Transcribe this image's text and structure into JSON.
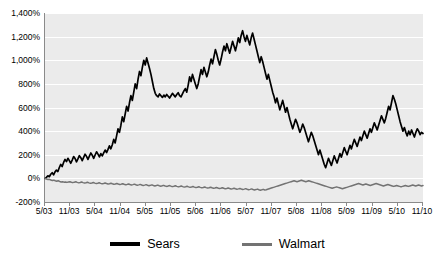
{
  "chart_data": {
    "type": "line",
    "title": "",
    "subtitle": "",
    "xlabel": "",
    "ylabel": "",
    "grid": true,
    "legend_position": "bottom",
    "ylim": [
      -200,
      1400
    ],
    "ytick_step": 200,
    "yticks": [
      1400,
      1200,
      1000,
      800,
      600,
      400,
      200,
      0,
      -200
    ],
    "ytick_labels": [
      "1,400%",
      "1,200%",
      "1,000%",
      "800%",
      "600%",
      "400%",
      "200%",
      "0%",
      "-200%"
    ],
    "xtick_labels": [
      "5/03",
      "11/03",
      "5/04",
      "11/04",
      "5/05",
      "11/05",
      "5/06",
      "11/06",
      "5/07",
      "11/07",
      "5/08",
      "11/08",
      "5/09",
      "11/09",
      "5/10",
      "11/10"
    ],
    "x_start": "5/03",
    "x_end": "11/10",
    "colors": {
      "sears": "#000000",
      "walmart": "#737373",
      "plot_background": "#ebebeb",
      "gridline": "#ffffff",
      "axis": "#8a8a8a"
    },
    "series": [
      {
        "name": "Sears",
        "color": "#000000",
        "values": [
          0,
          8,
          22,
          14,
          35,
          48,
          30,
          55,
          70,
          58,
          92,
          118,
          100,
          135,
          160,
          142,
          170,
          150,
          128,
          155,
          185,
          168,
          140,
          165,
          192,
          175,
          150,
          178,
          205,
          186,
          160,
          188,
          215,
          196,
          170,
          198,
          225,
          205,
          182,
          210,
          190,
          215,
          240,
          218,
          245,
          275,
          250,
          285,
          330,
          300,
          360,
          420,
          390,
          450,
          520,
          480,
          545,
          610,
          570,
          640,
          700,
          660,
          730,
          800,
          760,
          840,
          905,
          870,
          940,
          1000,
          960,
          1020,
          975,
          930,
          880,
          820,
          760,
          720,
          700,
          690,
          715,
          700,
          685,
          705,
          690,
          710,
          695,
          680,
          700,
          720,
          705,
          690,
          710,
          725,
          700,
          690,
          715,
          740,
          760,
          730,
          790,
          860,
          820,
          880,
          840,
          800,
          760,
          800,
          860,
          920,
          880,
          940,
          900,
          860,
          900,
          960,
          1010,
          970,
          1030,
          1090,
          1050,
          1000,
          960,
          1010,
          1070,
          1120,
          1080,
          1140,
          1100,
          1060,
          1110,
          1160,
          1120,
          1080,
          1130,
          1190,
          1150,
          1210,
          1250,
          1200,
          1160,
          1210,
          1170,
          1130,
          1190,
          1230,
          1180,
          1130,
          1080,
          1030,
          980,
          1030,
          990,
          940,
          890,
          840,
          880,
          830,
          780,
          730,
          690,
          640,
          680,
          630,
          580,
          620,
          660,
          610,
          560,
          600,
          550,
          500,
          460,
          420,
          460,
          500,
          470,
          430,
          390,
          420,
          460,
          430,
          390,
          350,
          310,
          350,
          390,
          360,
          320,
          280,
          240,
          200,
          240,
          200,
          160,
          120,
          90,
          130,
          170,
          140,
          110,
          150,
          190,
          160,
          130,
          170,
          210,
          180,
          220,
          260,
          230,
          200,
          240,
          280,
          250,
          290,
          330,
          300,
          270,
          310,
          350,
          320,
          360,
          400,
          370,
          340,
          380,
          420,
          390,
          430,
          470,
          440,
          410,
          450,
          490,
          530,
          500,
          470,
          510,
          560,
          610,
          580,
          640,
          700,
          670,
          630,
          580,
          530,
          480,
          440,
          400,
          430,
          390,
          360,
          400,
          370,
          410,
          380,
          350,
          390,
          420,
          400,
          370,
          390,
          380
        ]
      },
      {
        "name": "Walmart",
        "color": "#737373",
        "values": [
          0,
          -5,
          -10,
          -8,
          -14,
          -18,
          -15,
          -20,
          -24,
          -20,
          -26,
          -30,
          -28,
          -32,
          -30,
          -34,
          -31,
          -28,
          -33,
          -36,
          -32,
          -29,
          -34,
          -38,
          -35,
          -31,
          -36,
          -40,
          -37,
          -33,
          -38,
          -42,
          -39,
          -35,
          -40,
          -44,
          -41,
          -37,
          -42,
          -46,
          -43,
          -39,
          -44,
          -48,
          -45,
          -41,
          -46,
          -50,
          -47,
          -43,
          -48,
          -52,
          -49,
          -45,
          -50,
          -54,
          -51,
          -47,
          -52,
          -56,
          -53,
          -49,
          -54,
          -58,
          -55,
          -51,
          -56,
          -60,
          -57,
          -53,
          -58,
          -62,
          -59,
          -55,
          -60,
          -64,
          -61,
          -57,
          -62,
          -66,
          -63,
          -59,
          -64,
          -68,
          -65,
          -61,
          -66,
          -70,
          -67,
          -63,
          -68,
          -72,
          -69,
          -65,
          -70,
          -74,
          -71,
          -67,
          -72,
          -76,
          -73,
          -69,
          -74,
          -78,
          -75,
          -71,
          -76,
          -80,
          -77,
          -73,
          -78,
          -82,
          -79,
          -75,
          -80,
          -84,
          -81,
          -77,
          -82,
          -86,
          -83,
          -79,
          -84,
          -88,
          -85,
          -81,
          -86,
          -90,
          -87,
          -83,
          -88,
          -92,
          -89,
          -85,
          -90,
          -94,
          -91,
          -87,
          -92,
          -96,
          -93,
          -89,
          -94,
          -98,
          -95,
          -91,
          -96,
          -100,
          -97,
          -93,
          -98,
          -96,
          -92,
          -88,
          -84,
          -80,
          -76,
          -72,
          -68,
          -64,
          -60,
          -56,
          -52,
          -48,
          -44,
          -40,
          -36,
          -32,
          -28,
          -24,
          -20,
          -24,
          -28,
          -24,
          -20,
          -16,
          -20,
          -24,
          -28,
          -24,
          -20,
          -24,
          -28,
          -32,
          -36,
          -40,
          -44,
          -48,
          -52,
          -56,
          -60,
          -64,
          -68,
          -72,
          -76,
          -80,
          -84,
          -80,
          -76,
          -72,
          -76,
          -80,
          -84,
          -88,
          -84,
          -80,
          -76,
          -72,
          -68,
          -64,
          -60,
          -56,
          -52,
          -48,
          -44,
          -48,
          -52,
          -56,
          -52,
          -48,
          -52,
          -56,
          -60,
          -56,
          -52,
          -48,
          -44,
          -48,
          -52,
          -56,
          -60,
          -64,
          -60,
          -56,
          -52,
          -56,
          -60,
          -64,
          -68,
          -64,
          -60,
          -64,
          -68,
          -72,
          -68,
          -64,
          -60,
          -64,
          -68,
          -64,
          -60,
          -56,
          -60,
          -64,
          -60,
          -56,
          -60,
          -64,
          -60
        ]
      }
    ]
  },
  "legend": {
    "entries": [
      {
        "label": "Sears",
        "swatch": "sears"
      },
      {
        "label": "Walmart",
        "swatch": "walmart"
      }
    ]
  }
}
